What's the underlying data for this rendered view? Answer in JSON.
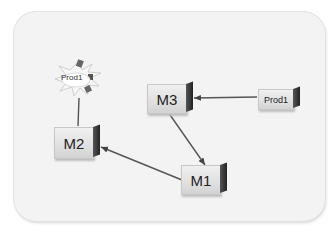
{
  "diagram": {
    "nodes": [
      {
        "id": "m2",
        "label": "M2"
      },
      {
        "id": "m3",
        "label": "M3"
      },
      {
        "id": "m1",
        "label": "M1"
      },
      {
        "id": "prod1_right",
        "label": "Prod1"
      },
      {
        "id": "prod1_burst",
        "label": "Prod1"
      }
    ],
    "edges": [
      {
        "from": "prod1_right",
        "to": "m3"
      },
      {
        "from": "m3",
        "to": "m1"
      },
      {
        "from": "m1",
        "to": "m2"
      },
      {
        "from": "m2",
        "to": "prod1_burst"
      }
    ]
  }
}
